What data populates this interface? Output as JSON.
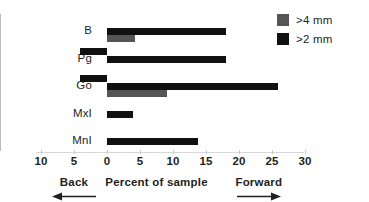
{
  "chart_data": {
    "type": "bar",
    "orientation": "horizontal",
    "title": "",
    "xlabel": "Percent of sample",
    "ylabel": "",
    "categories": [
      "B",
      "Pg",
      "Go",
      "MxI",
      "MnI"
    ],
    "series": [
      {
        "name": ">4 mm",
        "color": "#555555",
        "values": [
          4.2,
          0,
          9.1,
          0,
          0
        ]
      },
      {
        "name": ">2 mm",
        "color": "#111111",
        "values": [
          18.0,
          18.0,
          25.9,
          3.9,
          13.8
        ]
      },
      {
        "name": ">2 mm (back)",
        "color": "#111111",
        "values": [
          0,
          -4.1,
          -4.1,
          0,
          0
        ]
      }
    ],
    "xlim": [
      -10,
      30
    ],
    "xticks": [
      -10,
      -5,
      0,
      5,
      10,
      15,
      20,
      25,
      30
    ],
    "xticklabels": [
      "10",
      "5",
      "0",
      "5",
      "10",
      "15",
      "20",
      "25",
      "30"
    ],
    "grid": false,
    "legend_position": "top-right",
    "annotations": [
      {
        "text": "Back",
        "at": -5,
        "arrow": "left"
      },
      {
        "text": "Percent of sample",
        "at": 7.5,
        "arrow": "none"
      },
      {
        "text": "Forward",
        "at": 23,
        "arrow": "right"
      }
    ]
  },
  "axis": {
    "ticks": [
      {
        "label": "10",
        "value": -10
      },
      {
        "label": "5",
        "value": -5
      },
      {
        "label": "0",
        "value": 0
      },
      {
        "label": "5",
        "value": 5
      },
      {
        "label": "10",
        "value": 10
      },
      {
        "label": "15",
        "value": 15
      },
      {
        "label": "20",
        "value": 20
      },
      {
        "label": "25",
        "value": 25
      },
      {
        "label": "30",
        "value": 30
      }
    ],
    "captions": {
      "back": "Back",
      "center": "Percent of sample",
      "forward": "Forward"
    }
  },
  "legend": {
    "items": [
      {
        "label": ">4 mm",
        "color": "#555555",
        "swatch": "gray-square-icon"
      },
      {
        "label": ">2 mm",
        "color": "#111111",
        "swatch": "black-square-icon"
      }
    ]
  },
  "categories": {
    "items": [
      {
        "label": "B"
      },
      {
        "label": "Pg"
      },
      {
        "label": "Go"
      },
      {
        "label": "MxI"
      },
      {
        "label": "MnI"
      }
    ]
  }
}
